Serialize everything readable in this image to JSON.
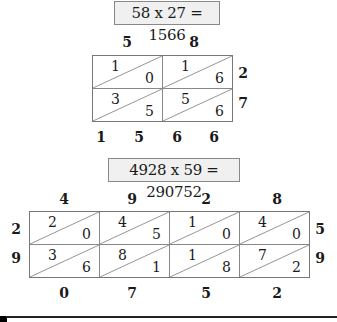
{
  "problem1": {
    "equation": "58 x 27 = 1566",
    "top_digits": [
      "5",
      "8"
    ],
    "side_digits": [
      "2",
      "7"
    ],
    "cells": [
      [
        {
          "tens": "1",
          "ones": "0"
        },
        {
          "tens": "1",
          "ones": "6"
        }
      ],
      [
        {
          "tens": "3",
          "ones": "5"
        },
        {
          "tens": "5",
          "ones": "6"
        }
      ]
    ],
    "result_digits": [
      "1",
      "5",
      "6",
      "6"
    ]
  },
  "problem2": {
    "equation": "4928 x 59 = 290752",
    "top_digits": [
      "4",
      "9",
      "2",
      "8"
    ],
    "left_digits": [
      "2",
      "9"
    ],
    "right_digits": [
      "5",
      "9"
    ],
    "cells": [
      [
        {
          "tens": "2",
          "ones": "0"
        },
        {
          "tens": "4",
          "ones": "5"
        },
        {
          "tens": "1",
          "ones": "0"
        },
        {
          "tens": "4",
          "ones": "0"
        }
      ],
      [
        {
          "tens": "3",
          "ones": "6"
        },
        {
          "tens": "8",
          "ones": "1"
        },
        {
          "tens": "1",
          "ones": "8"
        },
        {
          "tens": "7",
          "ones": "2"
        }
      ]
    ],
    "bottom_digits": [
      "0",
      "7",
      "5",
      "2"
    ]
  }
}
